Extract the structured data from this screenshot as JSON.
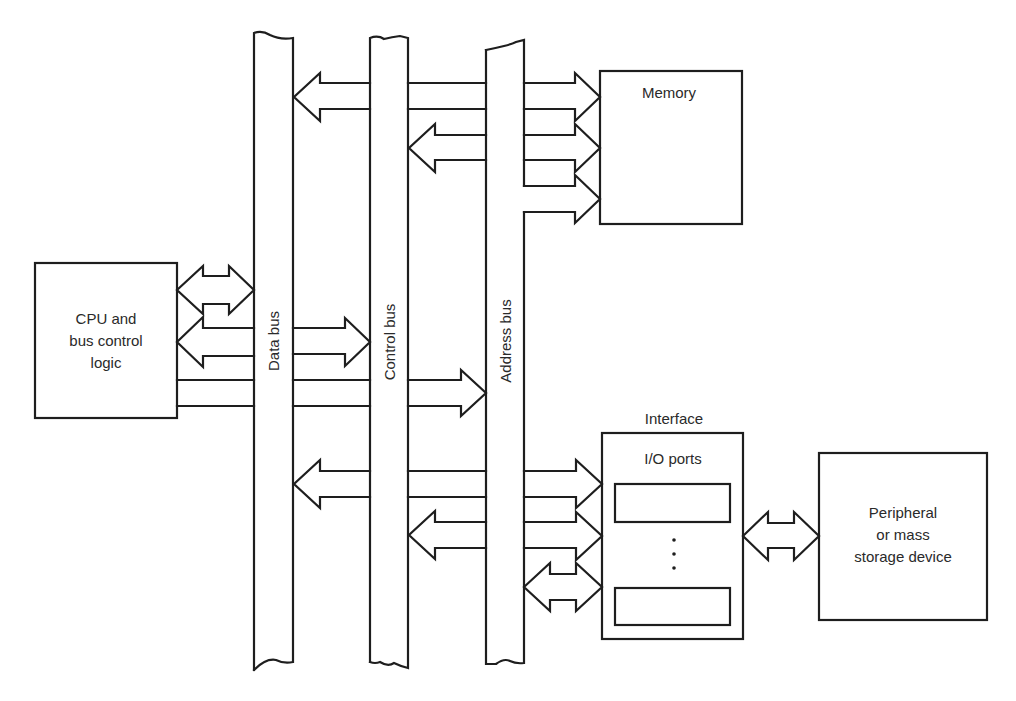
{
  "diagram": {
    "buses": [
      {
        "id": "data",
        "label": "Data bus"
      },
      {
        "id": "control",
        "label": "Control bus"
      },
      {
        "id": "address",
        "label": "Address bus"
      }
    ],
    "blocks": {
      "cpu": {
        "lines": [
          "CPU and",
          "bus control",
          "logic"
        ]
      },
      "memory": {
        "label": "Memory"
      },
      "interface": {
        "title": "Interface",
        "inner_label": "I/O ports"
      },
      "peripheral": {
        "lines": [
          "Peripheral",
          "or mass",
          "storage device"
        ]
      }
    },
    "connections": [
      {
        "from": "cpu",
        "to": "data bus",
        "direction": "bidirectional"
      },
      {
        "from": "control bus",
        "to": "cpu",
        "direction": "unidirectional"
      },
      {
        "from": "data bus",
        "to": "control bus",
        "direction": "unidirectional"
      },
      {
        "from": "cpu",
        "to": "address bus",
        "direction": "unidirectional"
      },
      {
        "from": "memory",
        "to": "data bus",
        "direction": "unidirectional"
      },
      {
        "from": "data bus",
        "to": "memory",
        "direction": "unidirectional"
      },
      {
        "from": "memory",
        "to": "control bus",
        "direction": "unidirectional"
      },
      {
        "from": "control bus",
        "to": "memory",
        "direction": "unidirectional"
      },
      {
        "from": "address bus",
        "to": "memory",
        "direction": "unidirectional"
      },
      {
        "from": "interface",
        "to": "data bus",
        "direction": "unidirectional"
      },
      {
        "from": "data bus",
        "to": "interface",
        "direction": "unidirectional"
      },
      {
        "from": "interface",
        "to": "control bus",
        "direction": "unidirectional"
      },
      {
        "from": "control bus",
        "to": "interface",
        "direction": "unidirectional"
      },
      {
        "from": "address bus",
        "to": "interface",
        "direction": "bidirectional"
      },
      {
        "from": "interface",
        "to": "peripheral",
        "direction": "bidirectional"
      }
    ],
    "ellipsis": "⋮"
  }
}
